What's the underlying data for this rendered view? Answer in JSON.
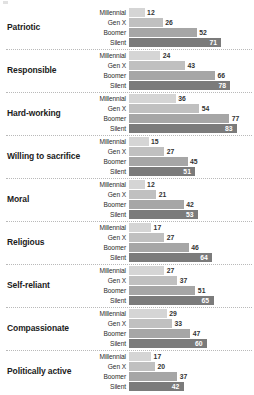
{
  "chart_data": {
    "type": "bar",
    "orientation": "horizontal",
    "title": "",
    "subtitle": "",
    "xlabel": "",
    "ylabel": "",
    "grid": false,
    "legend_position": "none",
    "xlim": [
      0,
      83
    ],
    "categories": [
      "Patriotic",
      "Responsible",
      "Hard-working",
      "Willing to sacrifice",
      "Moral",
      "Religious",
      "Self-reliant",
      "Compassionate",
      "Politically active"
    ],
    "series": [
      {
        "name": "Millennial",
        "color": "#d5d5d5",
        "values": [
          12,
          24,
          36,
          15,
          12,
          17,
          27,
          29,
          17
        ]
      },
      {
        "name": "Gen X",
        "color": "#c0c0c0",
        "values": [
          26,
          43,
          54,
          27,
          21,
          27,
          37,
          33,
          20
        ]
      },
      {
        "name": "Boomer",
        "color": "#a6a6a6",
        "values": [
          52,
          66,
          77,
          45,
          42,
          46,
          51,
          47,
          37
        ]
      },
      {
        "name": "Silent",
        "color": "#7b7b7b",
        "values": [
          71,
          78,
          83,
          51,
          53,
          64,
          65,
          60,
          42
        ]
      }
    ]
  },
  "colors": {
    "millennial": "#d5d5d5",
    "gen_x": "#c0c0c0",
    "boomer": "#a6a6a6",
    "silent": "#7b7b7b",
    "separator": "#b9b9b9",
    "label_text": "#1c1c1c",
    "value_outside": "#333333",
    "value_inside": "#ffffff",
    "background": "#ffffff"
  }
}
